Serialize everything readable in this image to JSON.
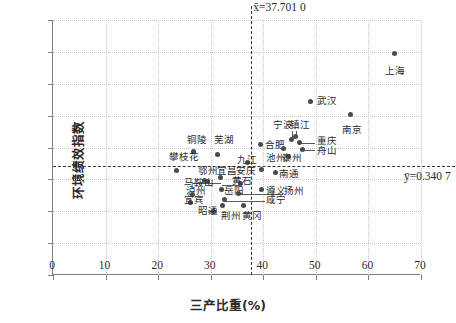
{
  "chart_data": {
    "type": "scatter",
    "title": "",
    "xlabel": "三产比重(%)",
    "ylabel": "环境绩效指数",
    "xlim": [
      0,
      70
    ],
    "ylim": [
      0,
      0.8
    ],
    "xticks": [
      "0",
      "10",
      "20",
      "30",
      "40",
      "50",
      "60",
      "70"
    ],
    "yticks": [
      "0",
      "0.1",
      "0.2",
      "0.3",
      "0.4",
      "0.5",
      "0.6",
      "0.7",
      "0.8"
    ],
    "grid": true,
    "legend": "none",
    "annotations": [
      {
        "name": "x-mean",
        "text": "x̄=37.701 0",
        "value": 37.701,
        "orientation": "vertical"
      },
      {
        "name": "y-mean",
        "text": "ȳ=0.340 7",
        "value": 0.3407,
        "orientation": "horizontal"
      }
    ],
    "points": [
      {
        "label": "上海",
        "x": 65.0,
        "y": 0.695,
        "lx": 63.2,
        "ly": 0.64
      },
      {
        "label": "武汉",
        "x": 49.0,
        "y": 0.545,
        "lx": 50.2,
        "ly": 0.545
      },
      {
        "label": "南京",
        "x": 56.5,
        "y": 0.505,
        "lx": 55.0,
        "ly": 0.455
      },
      {
        "label": "镇江",
        "x": 46.2,
        "y": 0.433,
        "lx": 45.0,
        "ly": 0.47
      },
      {
        "label": "宁波",
        "x": 45.4,
        "y": 0.425,
        "lx": 41.8,
        "ly": 0.47
      },
      {
        "label": "重庆",
        "x": 46.9,
        "y": 0.415,
        "lx": 50.3,
        "ly": 0.42
      },
      {
        "label": "合肥",
        "x": 39.5,
        "y": 0.408,
        "lx": 40.4,
        "ly": 0.408
      },
      {
        "label": "池州",
        "x": 43.8,
        "y": 0.396,
        "lx": 40.6,
        "ly": 0.368
      },
      {
        "label": "舟山",
        "x": 47.4,
        "y": 0.394,
        "lx": 50.3,
        "ly": 0.388
      },
      {
        "label": "铜陵",
        "x": 26.8,
        "y": 0.387,
        "lx": 25.5,
        "ly": 0.425
      },
      {
        "label": "芜湖",
        "x": 31.2,
        "y": 0.379,
        "lx": 30.6,
        "ly": 0.425
      },
      {
        "label": "泰州",
        "x": 44.8,
        "y": 0.372,
        "lx": 43.6,
        "ly": 0.368
      },
      {
        "label": "九江",
        "x": 37.0,
        "y": 0.352,
        "lx": 35.0,
        "ly": 0.362
      },
      {
        "label": "攀枝花",
        "x": 23.5,
        "y": 0.328,
        "lx": 22.0,
        "ly": 0.37
      },
      {
        "label": "安庆",
        "x": 39.6,
        "y": 0.332,
        "lx": 34.8,
        "ly": 0.325
      },
      {
        "label": "南通",
        "x": 42.4,
        "y": 0.322,
        "lx": 43.0,
        "ly": 0.318
      },
      {
        "label": "鄂州",
        "x": 28.9,
        "y": 0.296,
        "lx": 27.6,
        "ly": 0.325
      },
      {
        "label": "宜昌",
        "x": 31.8,
        "y": 0.305,
        "lx": 31.2,
        "ly": 0.325
      },
      {
        "label": "黄石",
        "x": 35.7,
        "y": 0.288,
        "lx": 34.0,
        "ly": 0.295
      },
      {
        "label": "马鞍山",
        "x": 29.3,
        "y": 0.292,
        "lx": 24.9,
        "ly": 0.29
      },
      {
        "label": "岳阳",
        "x": 32.0,
        "y": 0.268,
        "lx": 32.6,
        "ly": 0.262
      },
      {
        "label": "泸州",
        "x": 26.5,
        "y": 0.252,
        "lx": 25.3,
        "ly": 0.262
      },
      {
        "label": "遵义",
        "x": 39.6,
        "y": 0.268,
        "lx": 40.5,
        "ly": 0.262
      },
      {
        "label": "扬州",
        "x": 35.3,
        "y": 0.256,
        "lx": 44.0,
        "ly": 0.262
      },
      {
        "label": "宜宾",
        "x": 26.2,
        "y": 0.228,
        "lx": 24.9,
        "ly": 0.235
      },
      {
        "label": "咸宁",
        "x": 32.6,
        "y": 0.236,
        "lx": 40.5,
        "ly": 0.234
      },
      {
        "label": "荆州",
        "x": 32.2,
        "y": 0.218,
        "lx": 32.0,
        "ly": 0.185
      },
      {
        "label": "黄冈",
        "x": 36.3,
        "y": 0.217,
        "lx": 36.0,
        "ly": 0.185
      },
      {
        "label": "昭通",
        "x": 30.6,
        "y": 0.2,
        "lx": 27.6,
        "ly": 0.202
      }
    ],
    "leaders": [
      {
        "name": "leader-chongqing",
        "x1": 47.0,
        "y1": 0.414,
        "x2": 49.9,
        "y2": 0.414
      },
      {
        "name": "leader-zhoushan",
        "x1": 47.5,
        "y1": 0.392,
        "x2": 49.9,
        "y2": 0.392
      },
      {
        "name": "leader-ningbo",
        "x1": 45.4,
        "y1": 0.428,
        "x2": 45.4,
        "y2": 0.452
      },
      {
        "name": "leader-zhenjiang",
        "x1": 46.2,
        "y1": 0.437,
        "x2": 46.2,
        "y2": 0.452
      },
      {
        "name": "leader-maanshan",
        "x1": 26.6,
        "y1": 0.288,
        "x2": 31.9,
        "y2": 0.288
      },
      {
        "name": "leader-huangshi",
        "x1": 32.2,
        "y1": 0.281,
        "x2": 35.6,
        "y2": 0.281
      },
      {
        "name": "leader-yangzhou",
        "x1": 35.3,
        "y1": 0.254,
        "x2": 43.8,
        "y2": 0.254
      },
      {
        "name": "leader-xianning",
        "x1": 32.8,
        "y1": 0.232,
        "x2": 40.3,
        "y2": 0.232
      },
      {
        "name": "leader-zhaotong",
        "x1": 29.5,
        "y1": 0.197,
        "x2": 30.6,
        "y2": 0.203
      },
      {
        "name": "leader-jiujiang",
        "x1": 36.6,
        "y1": 0.352,
        "x2": 37.0,
        "y2": 0.352
      }
    ]
  }
}
